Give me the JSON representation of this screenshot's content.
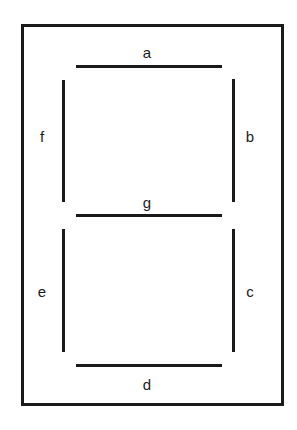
{
  "diagram": {
    "colors": {
      "stroke": "#1a1a1a",
      "background": "#ffffff"
    },
    "segments": [
      {
        "id": "a",
        "label": "a",
        "orientation": "horizontal",
        "position": "top"
      },
      {
        "id": "b",
        "label": "b",
        "orientation": "vertical",
        "position": "upper-right"
      },
      {
        "id": "c",
        "label": "c",
        "orientation": "vertical",
        "position": "lower-right"
      },
      {
        "id": "d",
        "label": "d",
        "orientation": "horizontal",
        "position": "bottom"
      },
      {
        "id": "e",
        "label": "e",
        "orientation": "vertical",
        "position": "lower-left"
      },
      {
        "id": "f",
        "label": "f",
        "orientation": "vertical",
        "position": "upper-left"
      },
      {
        "id": "g",
        "label": "g",
        "orientation": "horizontal",
        "position": "middle"
      }
    ]
  }
}
